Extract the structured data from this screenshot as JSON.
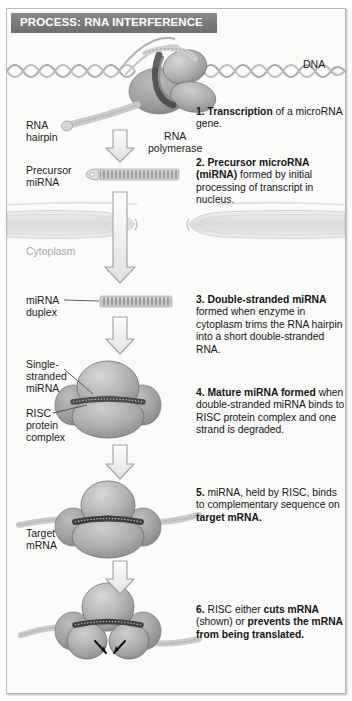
{
  "banner": {
    "title": "PROCESS: RNA INTERFERENCE"
  },
  "labels": {
    "dna": "DNA",
    "rna_hairpin": "RNA\nhairpin",
    "rna_polymerase": "RNA\npolymerase",
    "precursor_mirna": "Precursor\nmiRNA",
    "cytoplasm": "Cytoplasm",
    "mirna_duplex": "miRNA\nduplex",
    "single_stranded_mirna": "Single-\nstranded\nmiRNA",
    "risc_protein_complex": "RISC\nprotein\ncomplex",
    "target_mrna": "Target\nmRNA"
  },
  "steps": [
    {
      "number": "1.",
      "bold_lead": "Transcription",
      "rest": " of a microRNA gene."
    },
    {
      "number": "2.",
      "bold_lead": "Precursor microRNA (miRNA)",
      "rest": " formed by initial processing of transcript in nucleus."
    },
    {
      "number": "3.",
      "bold_lead": "Double-stranded miRNA",
      "rest": " formed when enzyme in cytoplasm trims the RNA hairpin into a short double-stranded RNA."
    },
    {
      "number": "4.",
      "bold_lead": "Mature miRNA formed",
      "rest": " when double-stranded miRNA binds to RISC protein complex and one strand is degraded."
    },
    {
      "number": "5.",
      "plain_lead": " miRNA, held by RISC, binds to complementary sequence on ",
      "bold_tail": "target mRNA."
    },
    {
      "number": "6.",
      "plain_lead": " RISC either ",
      "bold_mid": "cuts mRNA",
      "plain_mid": " (shown) or ",
      "bold_tail": "prevents the mRNA from being translated."
    }
  ],
  "colors": {
    "banner_bg": "#7e7e7e",
    "banner_text": "#ffffff",
    "page_bg": "#fbfbfa",
    "border": "#b9b9b9",
    "text": "#1b1b1b",
    "cytoplasm_label": "#a8a8a8",
    "blob_fill": "#b0b0b0",
    "blob_dark": "#8e8e8e",
    "arrow_outline": "#9a9a9a",
    "arrow_fill": "#f2f2f2",
    "strand": "#c4c4c4",
    "cut_arrow": "#101010"
  }
}
